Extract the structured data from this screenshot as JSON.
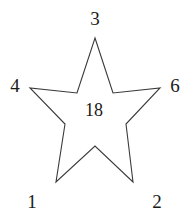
{
  "figure": {
    "name": "five-pointed-star-with-numbered-vertices",
    "background_color": "#ffffff",
    "stroke_color": "#3a3a3a",
    "stroke_width": 1.1,
    "fill": "none",
    "canvas": {
      "width": 188,
      "height": 221
    }
  },
  "star": {
    "outer_points": [
      {
        "id": "top",
        "x": 95,
        "y": 38
      },
      {
        "id": "right",
        "x": 160,
        "y": 88
      },
      {
        "id": "bottom-right",
        "x": 133,
        "y": 182
      },
      {
        "id": "bottom-left",
        "x": 56,
        "y": 182
      },
      {
        "id": "left",
        "x": 30,
        "y": 88
      }
    ],
    "inner_points": [
      {
        "id": "upper-right",
        "x": 113,
        "y": 93
      },
      {
        "id": "right-lower",
        "x": 126,
        "y": 124
      },
      {
        "id": "bottom",
        "x": 95,
        "y": 146
      },
      {
        "id": "left-lower",
        "x": 65,
        "y": 124
      },
      {
        "id": "upper-left",
        "x": 77,
        "y": 93
      }
    ],
    "polygon_points": "95,38 113,93 160,88 126,124 133,182 95,146 56,182 65,124 30,88 77,93"
  },
  "labels": {
    "top": {
      "text": "3",
      "x": 95,
      "y": 18
    },
    "left": {
      "text": "4",
      "x": 15,
      "y": 85
    },
    "right": {
      "text": "6",
      "x": 175,
      "y": 85
    },
    "bottom_left": {
      "text": "1",
      "x": 32,
      "y": 201
    },
    "bottom_right": {
      "text": "2",
      "x": 157,
      "y": 201
    },
    "center": {
      "text": "18",
      "x": 94,
      "y": 110
    }
  }
}
